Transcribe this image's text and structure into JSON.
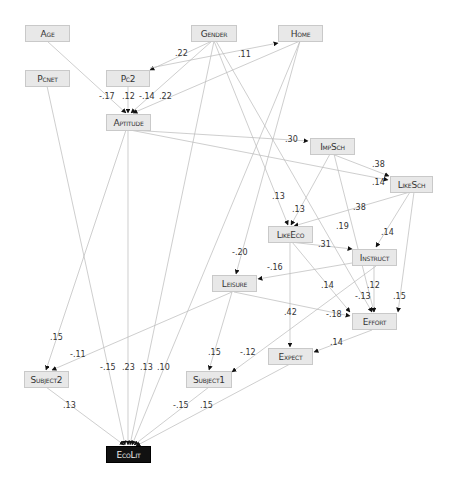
{
  "diagram": {
    "type": "path-diagram",
    "nodes": {
      "age": "Age",
      "pcnet": "Pcnet",
      "pc2": "Pc2",
      "gender": "Gender",
      "home": "Home",
      "aptitude": "Aptitude",
      "impsch": "ImpSch",
      "likesch": "LikeSch",
      "likeeco": "LikeEco",
      "instruct": "Instruct",
      "leisure": "Leisure",
      "effort": "Effort",
      "expect": "Expect",
      "subject1": "Subject1",
      "subject2": "Subject2",
      "ecolit": "EcoLit"
    },
    "edges": [
      {
        "from": "Gender",
        "to": "Pc2",
        "coef": ".22"
      },
      {
        "from": "Gender",
        "to": "Home",
        "coef": ".11"
      },
      {
        "from": "Age",
        "to": "Aptitude",
        "coef": "-.17"
      },
      {
        "from": "Pc2",
        "to": "Aptitude",
        "coef": ".12"
      },
      {
        "from": "Gender",
        "to": "Aptitude",
        "coef": "-.14"
      },
      {
        "from": "Home",
        "to": "Aptitude",
        "coef": ".22"
      },
      {
        "from": "Aptitude",
        "to": "ImpSch",
        "coef": ".30"
      },
      {
        "from": "Aptitude",
        "to": "LikeSch",
        "coef": ".14"
      },
      {
        "from": "ImpSch",
        "to": "LikeSch",
        "coef": ".38"
      },
      {
        "from": "Gender",
        "to": "LikeEco",
        "coef": ".13"
      },
      {
        "from": "ImpSch",
        "to": "LikeEco",
        "coef": ".13"
      },
      {
        "from": "LikeSch",
        "to": "LikeEco",
        "coef": ".38"
      },
      {
        "from": "LikeEco",
        "to": "Instruct",
        "coef": ".31"
      },
      {
        "from": "LikeSch",
        "to": "Instruct",
        "coef": ".14"
      },
      {
        "from": "ImpSch",
        "to": "Effort",
        "coef": ".19"
      },
      {
        "from": "Home",
        "to": "Leisure",
        "coef": "-.20"
      },
      {
        "from": "Instruct",
        "to": "Leisure",
        "coef": "-.16"
      },
      {
        "from": "LikeEco",
        "to": "Effort",
        "coef": ".14"
      },
      {
        "from": "Instruct",
        "to": "Effort",
        "coef": ".12"
      },
      {
        "from": "Gender",
        "to": "Effort",
        "coef": "-.13"
      },
      {
        "from": "LikeSch",
        "to": "Effort",
        "coef": ".15"
      },
      {
        "from": "Leisure",
        "to": "Effort",
        "coef": "-.18"
      },
      {
        "from": "LikeEco",
        "to": "Expect",
        "coef": ".42"
      },
      {
        "from": "Effort",
        "to": "Expect",
        "coef": ".14"
      },
      {
        "from": "Leisure",
        "to": "Subject1",
        "coef": ".15"
      },
      {
        "from": "Instruct",
        "to": "Subject1",
        "coef": "-.12"
      },
      {
        "from": "Aptitude",
        "to": "Subject2",
        "coef": ".15"
      },
      {
        "from": "Leisure",
        "to": "Subject2",
        "coef": "-.11"
      },
      {
        "from": "Pcnet",
        "to": "EcoLit",
        "coef": "-.15"
      },
      {
        "from": "Aptitude",
        "to": "EcoLit",
        "coef": ".23"
      },
      {
        "from": "Gender",
        "to": "EcoLit",
        "coef": ".13"
      },
      {
        "from": "Home",
        "to": "EcoLit",
        "coef": ".10"
      },
      {
        "from": "Subject2",
        "to": "EcoLit",
        "coef": ".13"
      },
      {
        "from": "Subject1",
        "to": "EcoLit",
        "coef": "-.15"
      },
      {
        "from": "Expect",
        "to": "EcoLit",
        "coef": ".15"
      }
    ],
    "labels": {
      "l_gender_pc2": ".22",
      "l_gender_home": ".11",
      "l_age_apt": "-.17",
      "l_pc2_apt": ".12",
      "l_gender_apt": "-.14",
      "l_home_apt": ".22",
      "l_apt_impsch": ".30",
      "l_impsch_likesch": ".38",
      "l_apt_likesch": ".14",
      "l_gender_likeeco": ".13",
      "l_impsch_likeeco": ".13",
      "l_likesch_likeeco": ".38",
      "l_impsch_effort": ".19",
      "l_likeeco_instruct": ".31",
      "l_likesch_instruct": ".14",
      "l_home_leisure": "-.20",
      "l_instruct_leisure": "-.16",
      "l_likeeco_effort": ".14",
      "l_instruct_effort": ".12",
      "l_gender_effort": "-.13",
      "l_likesch_effort": ".15",
      "l_leisure_effort": "-.18",
      "l_likeeco_expect": ".42",
      "l_effort_expect": ".14",
      "l_apt_subject2": ".15",
      "l_leisure_subject2": "-.11",
      "l_leisure_subject1": ".15",
      "l_instruct_subject1": "-.12",
      "l_pcnet_ecolit": "-.15",
      "l_apt_ecolit": ".23",
      "l_gender_ecolit": ".13",
      "l_home_ecolit": ".10",
      "l_subject2_ecolit": ".13",
      "l_subject1_ecolit": "-.15",
      "l_expect_ecolit": ".15"
    },
    "colors": {
      "node_fill": "#e8e8e8",
      "node_border": "#c9c9c9",
      "outcome_fill": "#111111",
      "edge": "#b5b5b5",
      "arrowhead": "#111111"
    }
  }
}
